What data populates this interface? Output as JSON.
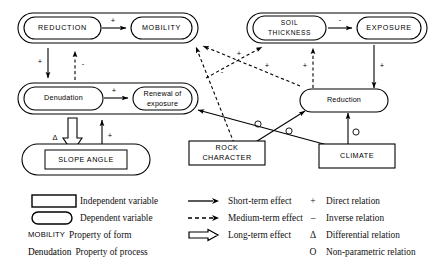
{
  "diagram": {
    "groups": [
      {
        "id": "group-form-left",
        "label": "form-group-reduction-mobility"
      },
      {
        "id": "group-form-right",
        "label": "form-group-soil-exposure"
      },
      {
        "id": "group-process-left",
        "label": "process-group-denudation-renewal"
      },
      {
        "id": "group-process-right",
        "label": "process-group-reduction"
      }
    ],
    "nodes": [
      {
        "id": "reduction-caps",
        "label": "REDUCTION",
        "shape": "rounded",
        "kind": "dependent",
        "property": "form"
      },
      {
        "id": "mobility",
        "label": "MOBILITY",
        "shape": "rounded",
        "kind": "dependent",
        "property": "form"
      },
      {
        "id": "soil-thickness",
        "label": "SOIL THICKNESS",
        "line1": "SOIL",
        "line2": "THICKNESS",
        "shape": "rounded",
        "kind": "dependent",
        "property": "form"
      },
      {
        "id": "exposure",
        "label": "EXPOSURE",
        "shape": "rounded",
        "kind": "dependent",
        "property": "form"
      },
      {
        "id": "denudation",
        "label": "Denudation",
        "shape": "rounded",
        "kind": "dependent",
        "property": "process"
      },
      {
        "id": "renewal-of-exposure",
        "label": "Renewal of exposure",
        "line1": "Renewal  of",
        "line2": "exposure",
        "shape": "rounded",
        "kind": "dependent",
        "property": "process"
      },
      {
        "id": "reduction-mixed",
        "label": "Reduction",
        "shape": "rounded",
        "kind": "dependent",
        "property": "process"
      },
      {
        "id": "slope-angle",
        "label": "SLOPE ANGLE",
        "shape": "rect-in-rounded",
        "kind": "mixed",
        "property": "form"
      },
      {
        "id": "rock-character",
        "label": "ROCK CHARACTER",
        "line1": "ROCK",
        "line2": "CHARACTER",
        "shape": "rect",
        "kind": "independent"
      },
      {
        "id": "climate",
        "label": "CLIMATE",
        "shape": "rect",
        "kind": "independent"
      }
    ],
    "edges": [
      {
        "id": "e1",
        "from": "reduction-caps",
        "to": "mobility",
        "effect": "short-term",
        "relation": "+"
      },
      {
        "id": "e2",
        "from": "soil-thickness",
        "to": "exposure",
        "effect": "short-term",
        "relation": "-"
      },
      {
        "id": "e3",
        "from": "reduction-caps",
        "to": "denudation",
        "effect": "short-term",
        "relation": "+"
      },
      {
        "id": "e4",
        "from": "denudation",
        "to": "reduction-caps",
        "effect": "medium-term",
        "relation": "-"
      },
      {
        "id": "e5",
        "from": "denudation",
        "to": "renewal-of-exposure",
        "effect": "short-term",
        "relation": "+"
      },
      {
        "id": "e6",
        "from": "denudation",
        "to": "slope-angle",
        "effect": "long-term",
        "relation": "Δ"
      },
      {
        "id": "e7",
        "from": "slope-angle",
        "to": "renewal-of-exposure",
        "effect": "short-term",
        "relation": "+"
      },
      {
        "id": "e8",
        "from": "exposure",
        "to": "reduction-mixed",
        "effect": "short-term",
        "relation": "+"
      },
      {
        "id": "e9",
        "from": "reduction-mixed",
        "to": "soil-thickness",
        "effect": "medium-term",
        "relation": "+"
      },
      {
        "id": "e10",
        "from": "renewal-of-exposure",
        "to": "soil-thickness",
        "effect": "medium-term",
        "relation": "+"
      },
      {
        "id": "e11",
        "from": "reduction-mixed",
        "to": "mobility",
        "effect": "medium-term",
        "relation": "+"
      },
      {
        "id": "e12",
        "from": "rock-character",
        "to": "mobility",
        "effect": "medium-term",
        "relation": "-"
      },
      {
        "id": "e13",
        "from": "rock-character",
        "to": "reduction-mixed",
        "effect": "short-term",
        "relation": "O"
      },
      {
        "id": "e14",
        "from": "climate",
        "to": "renewal-of-exposure",
        "effect": "short-term",
        "relation": "O"
      },
      {
        "id": "e15",
        "from": "climate",
        "to": "reduction-mixed",
        "effect": "short-term",
        "relation": "O"
      }
    ],
    "edge_symbols": [
      "+",
      "-",
      "Δ",
      "O"
    ]
  },
  "legend": {
    "shapes": [
      {
        "id": "independent-variable",
        "swatch": "rect",
        "label": "Independent variable"
      },
      {
        "id": "dependent-variable",
        "swatch": "rounded",
        "label": "Dependent variable"
      }
    ],
    "properties": [
      {
        "id": "property-of-form",
        "key": "MOBILITY",
        "key_style": "caps",
        "label": "Property of form"
      },
      {
        "id": "property-of-process",
        "key": "Denudation",
        "key_style": "mixed",
        "label": "Property of process"
      }
    ],
    "effects": [
      {
        "id": "short-term-effect",
        "line": "solid",
        "label": "Short-term effect"
      },
      {
        "id": "medium-term-effect",
        "line": "dashed",
        "label": "Medium-term effect"
      },
      {
        "id": "long-term-effect",
        "line": "hollow",
        "label": "Long-term effect"
      }
    ],
    "relations": [
      {
        "id": "direct-relation",
        "symbol": "+",
        "label": "Direct relation"
      },
      {
        "id": "inverse-relation",
        "symbol": "–",
        "label": "Inverse relation"
      },
      {
        "id": "differential-relation",
        "symbol": "Δ",
        "label": "Differential relation"
      },
      {
        "id": "non-parametric-relation",
        "symbol": "O",
        "label": "Non-parametric relation"
      }
    ]
  },
  "colors": {
    "ink": "#000000",
    "paper": "#ffffff"
  }
}
